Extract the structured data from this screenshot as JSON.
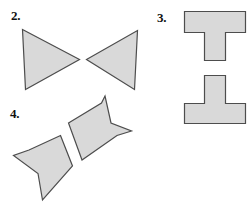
{
  "page": {
    "background_color": "#ffffff",
    "width": 252,
    "height": 205
  },
  "style": {
    "shape_fill": "#d9d9d9",
    "shape_stroke": "#4d4d4d",
    "label_color": "#111111"
  },
  "items": [
    {
      "id": "item-2",
      "label": "2.",
      "description": "Two mirrored triangles meeting point to point (bowtie arrangement)",
      "shapes": [
        {
          "name": "left-triangle",
          "points": "22.5,29.5 79.5,59.5 25.5,89.5"
        },
        {
          "name": "right-triangle",
          "points": "86.5,59.5 137.5,30.5 134.5,89.5"
        }
      ]
    },
    {
      "id": "item-3",
      "label": "3.",
      "description": "An upright T shape above an inverted T shape",
      "shapes": [
        {
          "name": "upright-t",
          "points": "184.5,11.5 245.5,11.5 245.5,32.5 225.5,32.5 225.5,60.5 204.5,60.5 204.5,32.5 184.5,32.5"
        },
        {
          "name": "inverted-t",
          "points": "204.5,75.5 225.5,75.5 225.5,103.5 245.5,103.5 245.5,123.5 184.5,123.5 184.5,103.5 204.5,103.5"
        }
      ]
    },
    {
      "id": "item-4",
      "label": "4.",
      "description": "Two congruent rotated quadrilaterals with concave notched corners",
      "shapes": [
        {
          "name": "upper-right-quad",
          "points": "105,96 111,123 131.5,131 117,135.5 82,160 68.5,123 101.5,103"
        },
        {
          "name": "lower-left-quad",
          "points": "60.5,135.5 72.5,166 42.5,200 38,173.5 13.5,155.5 29,150"
        }
      ]
    }
  ]
}
